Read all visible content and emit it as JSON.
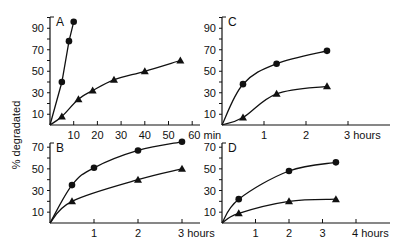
{
  "ylabel": "% degradated",
  "chart_data": [
    {
      "panel": "A",
      "type": "line",
      "xlabel": "min",
      "xticks": [
        10,
        20,
        30,
        40,
        50,
        60
      ],
      "xtick_suffix": "min",
      "yticks": [
        10,
        30,
        50,
        70,
        90
      ],
      "xlim": [
        0,
        60
      ],
      "ylim": [
        0,
        100
      ],
      "series": [
        {
          "name": "circles",
          "marker": "circle",
          "x": [
            0,
            5,
            8,
            10
          ],
          "y": [
            0,
            40,
            78,
            96
          ]
        },
        {
          "name": "triangles",
          "marker": "triangle",
          "x": [
            0,
            5,
            12,
            18,
            27,
            40,
            55
          ],
          "y": [
            0,
            8,
            24,
            32,
            42,
            50,
            60
          ]
        }
      ]
    },
    {
      "panel": "C",
      "type": "line",
      "xlabel": "hours",
      "xticks": [
        1,
        2,
        3
      ],
      "xtick_suffix": "hours",
      "yticks": [
        10,
        30,
        50,
        70,
        90
      ],
      "xlim": [
        0,
        3.5
      ],
      "ylim": [
        0,
        100
      ],
      "series": [
        {
          "name": "circles",
          "marker": "circle",
          "x": [
            0,
            0.5,
            1.3,
            2.5
          ],
          "y": [
            0,
            38,
            57,
            69
          ]
        },
        {
          "name": "triangles",
          "marker": "triangle",
          "x": [
            0,
            0.5,
            1.3,
            2.5
          ],
          "y": [
            0,
            7,
            29,
            36
          ]
        }
      ]
    },
    {
      "panel": "B",
      "type": "line",
      "xlabel": "hours",
      "xticks": [
        1,
        2,
        3
      ],
      "xtick_suffix": "hours",
      "yticks": [
        10,
        30,
        50,
        70
      ],
      "xlim": [
        0,
        3.5
      ],
      "ylim": [
        0,
        75
      ],
      "series": [
        {
          "name": "circles",
          "marker": "circle",
          "x": [
            0,
            0.5,
            1,
            2,
            3
          ],
          "y": [
            0,
            35,
            51,
            67,
            75
          ]
        },
        {
          "name": "triangles",
          "marker": "triangle",
          "x": [
            0,
            0.5,
            2,
            3
          ],
          "y": [
            0,
            20,
            40,
            50
          ]
        }
      ]
    },
    {
      "panel": "D",
      "type": "line",
      "xlabel": "hours",
      "xticks": [
        1,
        2,
        3,
        4
      ],
      "xtick_suffix": "hours",
      "yticks": [
        10,
        30,
        50,
        70
      ],
      "xlim": [
        0,
        4.5
      ],
      "ylim": [
        0,
        75
      ],
      "series": [
        {
          "name": "circles",
          "marker": "circle",
          "x": [
            0,
            0.5,
            2,
            3.4
          ],
          "y": [
            0,
            22,
            48,
            56
          ]
        },
        {
          "name": "triangles",
          "marker": "triangle",
          "x": [
            0,
            0.5,
            2,
            3.4
          ],
          "y": [
            0,
            9,
            20,
            22
          ]
        }
      ]
    }
  ],
  "layout": [
    {
      "ox": 50,
      "oy": 125,
      "w": 150,
      "top": 17,
      "xscale": 2.37,
      "yscale": 1.075
    },
    {
      "ox": 222,
      "oy": 125,
      "w": 168,
      "top": 17,
      "xscale": 42,
      "yscale": 1.075
    },
    {
      "ox": 50,
      "oy": 223,
      "w": 150,
      "top": 143,
      "xscale": 44,
      "yscale": 1.083
    },
    {
      "ox": 222,
      "oy": 223,
      "w": 168,
      "top": 143,
      "xscale": 33.5,
      "yscale": 1.083
    }
  ]
}
